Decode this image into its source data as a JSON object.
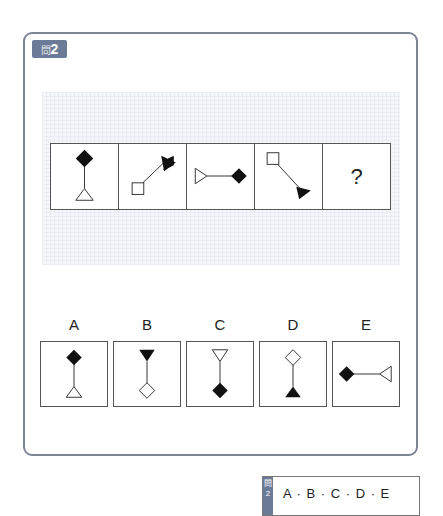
{
  "question": {
    "badge_kanji": "問",
    "badge_number": "2",
    "sequence": [
      {
        "id": "seq-1",
        "desc": "black diamond top, vertical line, white triangle bottom"
      },
      {
        "id": "seq-2",
        "desc": "white square bottom-left, diagonal line, black triangle top-right"
      },
      {
        "id": "seq-3",
        "desc": "white triangle left, horizontal line, black diamond right"
      },
      {
        "id": "seq-4",
        "desc": "white square top-left, diagonal line, black triangle bottom-right"
      },
      {
        "id": "seq-5",
        "desc": "unknown",
        "label": "?"
      }
    ]
  },
  "options": [
    {
      "label": "A",
      "desc": "black diamond top, white triangle bottom (pointing up)"
    },
    {
      "label": "B",
      "desc": "black triangle top (pointing down), white diamond bottom"
    },
    {
      "label": "C",
      "desc": "white triangle top (pointing down), black diamond bottom"
    },
    {
      "label": "D",
      "desc": "white diamond top, black triangle bottom (pointing up)"
    },
    {
      "label": "E",
      "desc": "black diamond left, white triangle right (pointing left)"
    }
  ],
  "answer_box": {
    "badge": "問2",
    "choices": "A · B · C · D · E"
  },
  "colors": {
    "frame_border": "#7d8595",
    "badge_bg": "#6b7b97",
    "grid_bg": "#f4f6f9"
  }
}
